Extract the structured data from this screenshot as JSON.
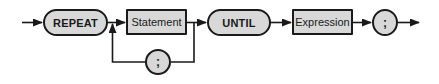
{
  "diagram": {
    "type": "syntax-railroad-diagram",
    "construct": "REPEAT statement",
    "colors": {
      "node_fill": "#d8d8d8",
      "stroke": "#1a1a1a",
      "background": "#ffffff"
    },
    "nodes": [
      {
        "id": "repeat",
        "kind": "keyword",
        "label": "REPEAT"
      },
      {
        "id": "statement",
        "kind": "nonterminal",
        "label": "Statement"
      },
      {
        "id": "loop_separator",
        "kind": "symbol",
        "label": ";"
      },
      {
        "id": "until",
        "kind": "keyword",
        "label": "UNTIL"
      },
      {
        "id": "expression",
        "kind": "nonterminal",
        "label": "Expression"
      },
      {
        "id": "terminator",
        "kind": "symbol",
        "label": ";"
      }
    ],
    "edges": [
      {
        "from": "entry",
        "to": "repeat"
      },
      {
        "from": "repeat",
        "to": "statement"
      },
      {
        "from": "statement",
        "to": "until"
      },
      {
        "from": "statement",
        "to": "loop_separator",
        "note": "loop back path"
      },
      {
        "from": "loop_separator",
        "to": "statement",
        "note": "returns before Statement"
      },
      {
        "from": "until",
        "to": "expression"
      },
      {
        "from": "expression",
        "to": "terminator"
      },
      {
        "from": "terminator",
        "to": "exit"
      }
    ]
  }
}
